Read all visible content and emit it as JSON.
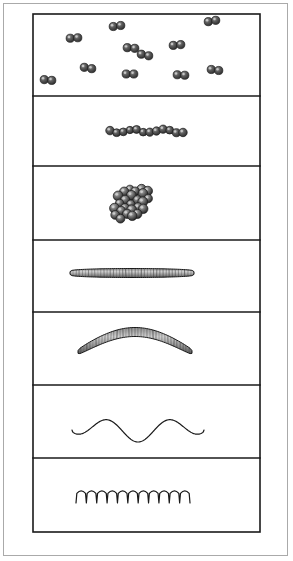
{
  "figure": {
    "kind": "scientific-line-illustration",
    "medium": "ink drawing",
    "canvas": {
      "width": 293,
      "height": 561,
      "background": "#ffffff"
    },
    "outer_frame": {
      "x": 3,
      "y": 3,
      "width": 285,
      "height": 553,
      "stroke": "#aaaaaa",
      "stroke_width": 1
    },
    "inner_frame": {
      "x": 33,
      "y": 14,
      "width": 227,
      "height": 518,
      "stroke": "#1a1a1a",
      "stroke_width": 1.6
    },
    "colors": {
      "ink": "#1a1a1a",
      "cell_fill_dark": "#3f3f3f",
      "cell_fill_mid": "#777777",
      "cell_fill_light": "#c2c2c2",
      "paper": "#ffffff",
      "outer_border": "#aaaaaa"
    },
    "panel_count": 7,
    "divider_y": [
      96,
      166,
      240,
      312,
      385,
      458
    ]
  },
  "panels": [
    {
      "index": 1,
      "name": "diplococci-panel",
      "morphology": "diplococci",
      "description": "scattered pairs of spherical cells",
      "bounds": {
        "x": 33,
        "y": 14,
        "width": 227,
        "height": 82
      },
      "cell_count": 22,
      "pair_count": 11,
      "cell_radius": 4.1,
      "pairs": [
        {
          "x": 48,
          "y": 80,
          "angle": 6
        },
        {
          "x": 74,
          "y": 38,
          "angle": -4
        },
        {
          "x": 88,
          "y": 68,
          "angle": 10
        },
        {
          "x": 117,
          "y": 26,
          "angle": -8
        },
        {
          "x": 131,
          "y": 48,
          "angle": 5
        },
        {
          "x": 130,
          "y": 74,
          "angle": 0
        },
        {
          "x": 145,
          "y": 55,
          "angle": 12
        },
        {
          "x": 177,
          "y": 45,
          "angle": -6
        },
        {
          "x": 181,
          "y": 75,
          "angle": 4
        },
        {
          "x": 212,
          "y": 21,
          "angle": -10
        },
        {
          "x": 215,
          "y": 70,
          "angle": 8
        }
      ]
    },
    {
      "index": 2,
      "name": "streptococci-panel",
      "morphology": "streptococci",
      "description": "single linear chain of spherical cells",
      "bounds": {
        "x": 33,
        "y": 96,
        "width": 227,
        "height": 70
      },
      "cell_count": 12,
      "cell_radius": 4.0,
      "chain": {
        "start_x": 110,
        "end_x": 183,
        "center_y": 131,
        "spacing": 6.6,
        "wobble": 1.6
      }
    },
    {
      "index": 3,
      "name": "staphylococci-panel",
      "morphology": "staphylococci",
      "description": "irregular grape-like cluster of spherical cells",
      "bounds": {
        "x": 33,
        "y": 166,
        "width": 227,
        "height": 74
      },
      "cell_count": 34,
      "cell_radius": 4.6,
      "cluster": {
        "center_x": 131,
        "center_y": 203,
        "spread_x": 21,
        "spread_y": 15,
        "tilt_deg": -34
      }
    },
    {
      "index": 4,
      "name": "bacillus-panel",
      "morphology": "bacillus",
      "description": "straight rod with rounded ends and transverse striations",
      "bounds": {
        "x": 33,
        "y": 240,
        "width": 227,
        "height": 72
      },
      "rod": {
        "start_x": 70,
        "end_x": 194,
        "center_y": 273,
        "thickness": 9,
        "curvature": 0,
        "striation_count": 40
      }
    },
    {
      "index": 5,
      "name": "vibrio-panel",
      "morphology": "vibrio",
      "description": "curved comma-shaped rod with transverse striations",
      "bounds": {
        "x": 33,
        "y": 312,
        "width": 227,
        "height": 73
      },
      "rod": {
        "start_x": 78,
        "end_x": 192,
        "center_y": 352,
        "thickness": 9,
        "arc_rise": 20,
        "striation_count": 38
      }
    },
    {
      "index": 6,
      "name": "spirillum-panel",
      "morphology": "spirillum",
      "description": "open wavy spiral filament, two broad wave cycles",
      "bounds": {
        "x": 33,
        "y": 385,
        "width": 227,
        "height": 73
      },
      "wave": {
        "start_x": 72,
        "end_x": 204,
        "center_y": 430,
        "amplitude": 12,
        "cycles": 2,
        "stroke_width": 1.2
      }
    },
    {
      "index": 7,
      "name": "spirochete-panel",
      "morphology": "spirochete",
      "description": "tightly coiled helical filament with many close turns",
      "bounds": {
        "x": 33,
        "y": 458,
        "width": 227,
        "height": 74
      },
      "coil": {
        "start_x": 76,
        "end_x": 190,
        "center_y": 497,
        "amplitude": 12,
        "turns": 11,
        "stroke_width": 1.2
      }
    }
  ]
}
